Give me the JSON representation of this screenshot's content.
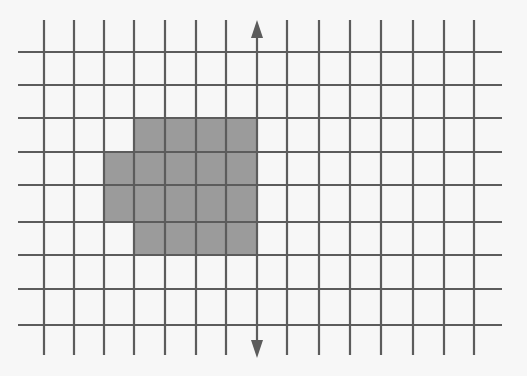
{
  "diagram": {
    "type": "grid-with-symmetry-line",
    "background": "#f7f7f7",
    "grid": {
      "line_color": "#5c5c5c",
      "line_width": 2.2,
      "columns_x": [
        44,
        74,
        104,
        134,
        165,
        196,
        226,
        257,
        287,
        319,
        350,
        381,
        413,
        444,
        474
      ],
      "rows_y": [
        52,
        85,
        118,
        152,
        185,
        222,
        255,
        289,
        325
      ],
      "horizontal_extent": [
        18,
        502
      ],
      "vertical_extent": [
        20,
        355
      ]
    },
    "shaded_shape": {
      "fill": "#9b9b9b",
      "description": "Shaded cells to the left of the symmetry line",
      "cells": [
        {
          "row": 2,
          "col_start": 3,
          "col_end": 7
        },
        {
          "row": 3,
          "col_start": 2,
          "col_end": 7
        },
        {
          "row": 4,
          "col_start": 2,
          "col_end": 7
        },
        {
          "row": 5,
          "col_start": 3,
          "col_end": 7
        }
      ]
    },
    "symmetry_line": {
      "label": "mirror-line",
      "column_index": 7,
      "x": 257,
      "y_top": 20,
      "y_bottom": 358,
      "color": "#5c5c5c",
      "arrow_top": true,
      "arrow_bottom": true
    }
  }
}
